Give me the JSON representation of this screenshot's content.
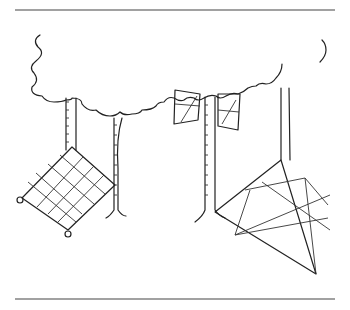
{
  "illustration": {
    "subject": "Trees with nets stretched between trunks and ground stakes",
    "elements": [
      "top-rule",
      "tree-canopy-left",
      "tree-canopy-right",
      "tree-trunks",
      "square-grid-net",
      "small-hanging-nets",
      "triangular-net",
      "bottom-rule"
    ],
    "colors": {
      "ink": "#222222",
      "background": "#ffffff",
      "rule": "#444444"
    }
  }
}
